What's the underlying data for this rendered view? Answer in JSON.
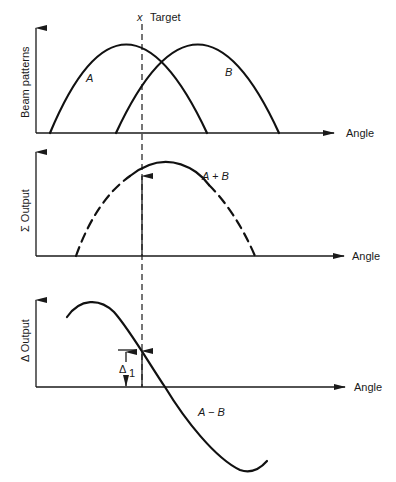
{
  "figure": {
    "target_label": "Target",
    "target_marker": "x",
    "panels": [
      {
        "id": "beam-patterns",
        "ylabel": "Beam patterns",
        "xlabel": "Angle",
        "curves": [
          {
            "label": "A",
            "style": "solid"
          },
          {
            "label": "B",
            "style": "solid"
          }
        ]
      },
      {
        "id": "sum-output",
        "ylabel": "Σ Output",
        "xlabel": "Angle",
        "curves": [
          {
            "label": "A + B",
            "style": "dashed ends, solid center"
          }
        ]
      },
      {
        "id": "difference-output",
        "ylabel": "Δ Output",
        "xlabel": "Angle",
        "curves": [
          {
            "label": "A − B",
            "style": "solid"
          }
        ],
        "annotation": {
          "symbol": "Δ",
          "subscript": "1"
        }
      }
    ]
  }
}
